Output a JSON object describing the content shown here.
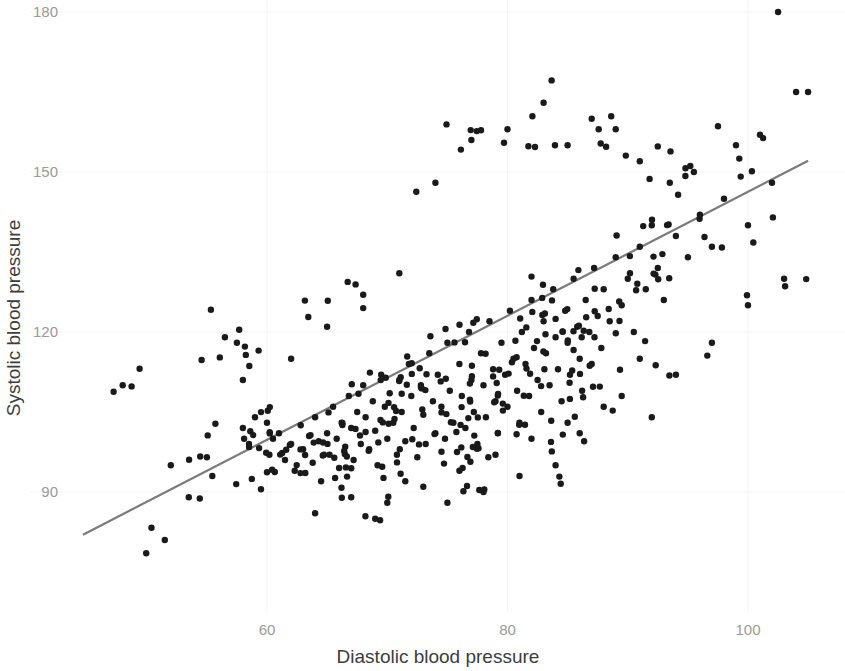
{
  "chart_data": {
    "type": "scatter",
    "title": "",
    "xlabel": "Diastolic blood pressure",
    "ylabel": "Systolic blood pressure",
    "xlim": [
      44,
      108
    ],
    "ylim": [
      78,
      182
    ],
    "xticks": [
      60,
      80,
      100
    ],
    "xtick_labels": [
      "60",
      "80",
      "100"
    ],
    "yticks": [
      90,
      120,
      150,
      180
    ],
    "ytick_labels": [
      "90",
      "120",
      "150",
      "180"
    ],
    "grid": true,
    "grid_color": "#f4f4f4",
    "background": "#ffffff",
    "point_color": "#1a1a1a",
    "point_size": 3.2,
    "legend": null,
    "fit_line": {
      "type": "linear",
      "color": "#7b7b7b",
      "x_start": 44.7,
      "y_start": 82.0,
      "x_end": 105.0,
      "y_end": 152.1
    },
    "n_points": 452,
    "points": [
      [
        48.0,
        110.0
      ],
      [
        51.5,
        81.0
      ],
      [
        53.5,
        89.0
      ],
      [
        52.0,
        95.0
      ],
      [
        55.0,
        96.5
      ],
      [
        56.5,
        119.0
      ],
      [
        57.5,
        118.0
      ],
      [
        58.0,
        102.0
      ],
      [
        58.5,
        99.0
      ],
      [
        59.0,
        104.0
      ],
      [
        59.5,
        90.5
      ],
      [
        60.0,
        103.0
      ],
      [
        60.5,
        100.0
      ],
      [
        60.2,
        97.0
      ],
      [
        61.0,
        101.0
      ],
      [
        61.5,
        96.0
      ],
      [
        62.0,
        99.0
      ],
      [
        62.3,
        94.0
      ],
      [
        62.8,
        102.5
      ],
      [
        63.0,
        98.0
      ],
      [
        63.5,
        100.5
      ],
      [
        63.8,
        95.5
      ],
      [
        64.0,
        104.0
      ],
      [
        64.3,
        99.5
      ],
      [
        64.5,
        92.0
      ],
      [
        65.0,
        101.0
      ],
      [
        65.2,
        97.0
      ],
      [
        65.5,
        106.0
      ],
      [
        65.8,
        100.0
      ],
      [
        66.0,
        94.5
      ],
      [
        66.2,
        103.0
      ],
      [
        66.5,
        98.5
      ],
      [
        66.8,
        108.0
      ],
      [
        67.0,
        102.0
      ],
      [
        67.2,
        96.0
      ],
      [
        67.5,
        105.0
      ],
      [
        67.8,
        99.0
      ],
      [
        68.0,
        110.0
      ],
      [
        68.2,
        104.0
      ],
      [
        68.5,
        98.0
      ],
      [
        68.8,
        107.0
      ],
      [
        69.0,
        101.5
      ],
      [
        69.2,
        95.0
      ],
      [
        69.5,
        112.0
      ],
      [
        69.8,
        106.0
      ],
      [
        70.0,
        100.0
      ],
      [
        70.2,
        108.5
      ],
      [
        70.5,
        103.0
      ],
      [
        70.8,
        97.0
      ],
      [
        71.0,
        111.0
      ],
      [
        71.2,
        105.0
      ],
      [
        71.5,
        99.5
      ],
      [
        71.8,
        114.0
      ],
      [
        72.0,
        108.0
      ],
      [
        72.2,
        102.0
      ],
      [
        72.5,
        96.5
      ],
      [
        72.8,
        110.0
      ],
      [
        73.0,
        104.5
      ],
      [
        73.2,
        99.0
      ],
      [
        73.5,
        116.0
      ],
      [
        73.8,
        107.0
      ],
      [
        74.0,
        101.0
      ],
      [
        74.2,
        112.0
      ],
      [
        74.5,
        106.0
      ],
      [
        74.8,
        100.0
      ],
      [
        75.0,
        118.0
      ],
      [
        75.2,
        109.0
      ],
      [
        75.5,
        103.0
      ],
      [
        75.8,
        97.5
      ],
      [
        76.0,
        114.0
      ],
      [
        76.2,
        108.0
      ],
      [
        76.5,
        102.0
      ],
      [
        76.8,
        120.0
      ],
      [
        77.0,
        111.0
      ],
      [
        77.2,
        105.0
      ],
      [
        77.5,
        99.0
      ],
      [
        77.8,
        116.0
      ],
      [
        78.0,
        110.0
      ],
      [
        78.2,
        104.0
      ],
      [
        78.5,
        122.0
      ],
      [
        78.8,
        113.0
      ],
      [
        79.0,
        107.0
      ],
      [
        79.2,
        101.0
      ],
      [
        79.5,
        118.0
      ],
      [
        79.8,
        112.0
      ],
      [
        80.0,
        106.0
      ],
      [
        80.2,
        124.0
      ],
      [
        80.5,
        115.0
      ],
      [
        80.8,
        109.0
      ],
      [
        81.0,
        103.0
      ],
      [
        81.2,
        120.0
      ],
      [
        81.5,
        114.0
      ],
      [
        81.8,
        108.0
      ],
      [
        82.0,
        126.0
      ],
      [
        82.2,
        117.0
      ],
      [
        82.5,
        111.0
      ],
      [
        82.8,
        105.0
      ],
      [
        83.0,
        122.0
      ],
      [
        83.2,
        116.0
      ],
      [
        83.5,
        110.0
      ],
      [
        83.8,
        128.0
      ],
      [
        84.0,
        119.0
      ],
      [
        84.2,
        113.0
      ],
      [
        84.5,
        107.0
      ],
      [
        84.8,
        124.0
      ],
      [
        85.0,
        118.0
      ],
      [
        85.2,
        112.0
      ],
      [
        85.5,
        130.0
      ],
      [
        85.8,
        121.0
      ],
      [
        86.0,
        115.0
      ],
      [
        86.2,
        109.0
      ],
      [
        86.5,
        126.0
      ],
      [
        86.8,
        120.0
      ],
      [
        87.0,
        114.0
      ],
      [
        87.2,
        132.0
      ],
      [
        87.5,
        123.0
      ],
      [
        87.8,
        117.0
      ],
      [
        88.0,
        128.0
      ],
      [
        88.5,
        122.0
      ],
      [
        89.0,
        134.0
      ],
      [
        89.5,
        125.0
      ],
      [
        90.0,
        130.0
      ],
      [
        90.5,
        120.0
      ],
      [
        91.0,
        136.0
      ],
      [
        91.5,
        128.0
      ],
      [
        92.0,
        140.0
      ],
      [
        92.5,
        132.0
      ],
      [
        93.0,
        126.0
      ],
      [
        94.0,
        138.0
      ],
      [
        95.0,
        134.0
      ],
      [
        96.0,
        142.0
      ],
      [
        97.0,
        136.0
      ],
      [
        98.0,
        145.0
      ],
      [
        100.0,
        140.0
      ],
      [
        102.0,
        148.0
      ],
      [
        104.0,
        165.0
      ],
      [
        105.0,
        165.0
      ],
      [
        102.5,
        180.0
      ],
      [
        101.0,
        157.0
      ],
      [
        99.0,
        155.0
      ],
      [
        95.5,
        150.0
      ],
      [
        93.5,
        148.0
      ],
      [
        91.0,
        152.0
      ],
      [
        89.0,
        158.0
      ],
      [
        87.0,
        160.0
      ],
      [
        85.0,
        155.0
      ],
      [
        83.0,
        163.0
      ],
      [
        80.0,
        158.0
      ],
      [
        77.0,
        156.0
      ],
      [
        74.0,
        148.0
      ],
      [
        71.0,
        131.0
      ],
      [
        68.0,
        127.0
      ],
      [
        65.0,
        121.0
      ],
      [
        62.0,
        115.0
      ],
      [
        58.0,
        111.0
      ],
      [
        70.0,
        88.0
      ],
      [
        73.0,
        91.0
      ],
      [
        76.0,
        94.0
      ],
      [
        79.0,
        97.0
      ],
      [
        82.0,
        100.0
      ],
      [
        85.0,
        103.0
      ],
      [
        88.0,
        106.0
      ],
      [
        91.0,
        115.0
      ],
      [
        94.0,
        112.0
      ],
      [
        97.0,
        118.0
      ],
      [
        100.0,
        125.0
      ],
      [
        103.0,
        130.0
      ],
      [
        86.0,
        101.0
      ],
      [
        89.5,
        108.0
      ],
      [
        92.0,
        104.0
      ],
      [
        64.0,
        86.0
      ],
      [
        67.0,
        89.0
      ],
      [
        69.0,
        85.0
      ],
      [
        71.5,
        92.0
      ],
      [
        75.0,
        88.0
      ],
      [
        78.0,
        90.0
      ],
      [
        81.0,
        93.0
      ],
      [
        84.0,
        95.0
      ]
    ]
  },
  "axes": {
    "x_title": "Diastolic blood pressure",
    "y_title": "Systolic blood pressure",
    "x_ticks": [
      "60",
      "80",
      "100"
    ],
    "y_ticks": [
      "180",
      "150",
      "120",
      "90"
    ]
  }
}
